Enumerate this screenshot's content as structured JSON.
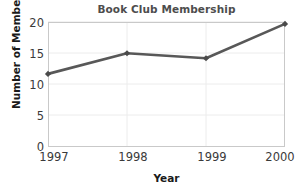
{
  "chart_data": {
    "type": "line",
    "title": "Book Club Membership",
    "xlabel": "Year",
    "ylabel": "Number of Members",
    "categories": [
      "1997",
      "1998",
      "1999",
      "2000"
    ],
    "x": [
      1997,
      1998,
      1999,
      2000
    ],
    "values": [
      11.7,
      15.0,
      14.2,
      19.7
    ],
    "series": [
      {
        "name": "Number of Members",
        "values": [
          11.7,
          15.0,
          14.2,
          19.7
        ]
      }
    ],
    "y_ticks": [
      "0",
      "5",
      "10",
      "15",
      "20"
    ],
    "y_tick_values": [
      0,
      5,
      10,
      15,
      20
    ],
    "x_ticks": [
      "1997",
      "1998",
      "1999",
      "2000"
    ],
    "ylim": [
      0,
      20
    ],
    "xlim": [
      1997,
      2000
    ],
    "grid": "horizontal-and-vertical-faint",
    "legend": "none",
    "line_color": "#585858",
    "marker_color": "#4a4a4a",
    "marker_shape": "diamond",
    "plot_border_color": "#c9c9c9",
    "gridline_color": "#e8e8e8",
    "background_color": "#ffffff",
    "title_color": "#4d4d4d",
    "axis_label_color": "#1a1a1a",
    "tick_label_color": "#3a3a3a"
  }
}
